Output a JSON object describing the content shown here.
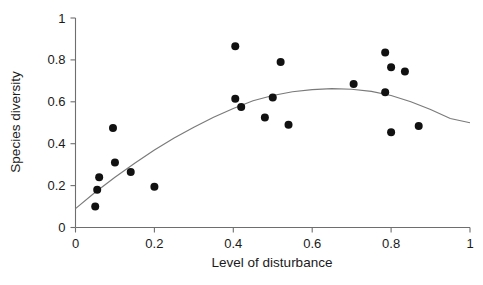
{
  "figure": {
    "background_color": "#ffffff",
    "point_color": "#111111",
    "curve_color": "#7a7a7a",
    "axis_color": "#6e6e6e",
    "caption_fragment": ""
  },
  "chart_data": {
    "type": "scatter",
    "title": "",
    "xlabel": "Level of disturbance",
    "ylabel": "Species diversity",
    "xlim": [
      0,
      1
    ],
    "ylim": [
      0,
      1
    ],
    "grid": false,
    "legend": null,
    "xticks": [
      0,
      0.2,
      0.4,
      0.6,
      0.8,
      1
    ],
    "xtick_labels": [
      "0",
      "0.2",
      "0.4",
      "0.6",
      "0.8",
      "1"
    ],
    "yticks": [
      0,
      0.2,
      0.4,
      0.6,
      0.8,
      1
    ],
    "ytick_labels": [
      "0",
      "0.2",
      "0.4",
      "0.6",
      "0.8",
      "1"
    ],
    "series": [
      {
        "name": "observations",
        "marker": "filled-circle",
        "marker_size": 4,
        "points": [
          {
            "x": 0.05,
            "y": 0.1
          },
          {
            "x": 0.055,
            "y": 0.18
          },
          {
            "x": 0.06,
            "y": 0.24
          },
          {
            "x": 0.095,
            "y": 0.475
          },
          {
            "x": 0.1,
            "y": 0.31
          },
          {
            "x": 0.14,
            "y": 0.265
          },
          {
            "x": 0.2,
            "y": 0.195
          },
          {
            "x": 0.405,
            "y": 0.865
          },
          {
            "x": 0.405,
            "y": 0.615
          },
          {
            "x": 0.42,
            "y": 0.575
          },
          {
            "x": 0.48,
            "y": 0.525
          },
          {
            "x": 0.5,
            "y": 0.62
          },
          {
            "x": 0.52,
            "y": 0.79
          },
          {
            "x": 0.54,
            "y": 0.49
          },
          {
            "x": 0.705,
            "y": 0.685
          },
          {
            "x": 0.785,
            "y": 0.835
          },
          {
            "x": 0.785,
            "y": 0.645
          },
          {
            "x": 0.8,
            "y": 0.765
          },
          {
            "x": 0.8,
            "y": 0.455
          },
          {
            "x": 0.835,
            "y": 0.745
          },
          {
            "x": 0.87,
            "y": 0.485
          }
        ]
      },
      {
        "name": "fitted-curve",
        "type": "line",
        "description": "quadratic trend line, intermediate disturbance hypothesis",
        "curve_points": [
          {
            "x": 0.0,
            "y": 0.09
          },
          {
            "x": 0.05,
            "y": 0.168
          },
          {
            "x": 0.1,
            "y": 0.24
          },
          {
            "x": 0.15,
            "y": 0.307
          },
          {
            "x": 0.2,
            "y": 0.37
          },
          {
            "x": 0.25,
            "y": 0.427
          },
          {
            "x": 0.3,
            "y": 0.479
          },
          {
            "x": 0.35,
            "y": 0.526
          },
          {
            "x": 0.4,
            "y": 0.568
          },
          {
            "x": 0.45,
            "y": 0.605
          },
          {
            "x": 0.5,
            "y": 0.63
          },
          {
            "x": 0.55,
            "y": 0.648
          },
          {
            "x": 0.6,
            "y": 0.658
          },
          {
            "x": 0.65,
            "y": 0.663
          },
          {
            "x": 0.7,
            "y": 0.66
          },
          {
            "x": 0.75,
            "y": 0.65
          },
          {
            "x": 0.8,
            "y": 0.63
          },
          {
            "x": 0.85,
            "y": 0.6
          },
          {
            "x": 0.9,
            "y": 0.563
          },
          {
            "x": 0.95,
            "y": 0.52
          },
          {
            "x": 1.0,
            "y": 0.5
          }
        ]
      }
    ]
  }
}
